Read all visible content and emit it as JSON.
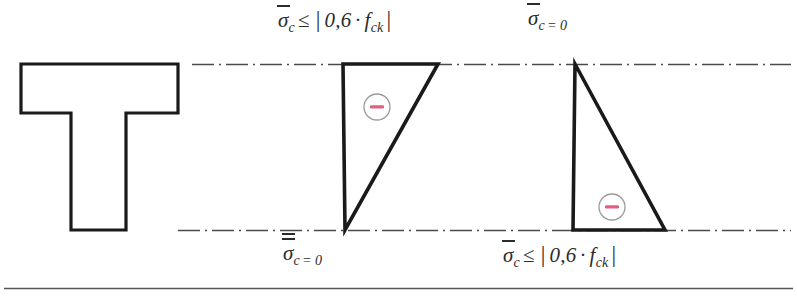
{
  "figure": {
    "colors": {
      "outline": "#1a1a1a",
      "centerline": "#4a4a4a",
      "sign_circle_stroke": "#9a9a9a",
      "sign_mark": "#e0607e",
      "text": "#2b2b2b",
      "footer_rule": "#555555",
      "background": "#ffffff"
    }
  },
  "labels": {
    "top_left": {
      "name": "stress-limit-top-left",
      "sigma": "σ",
      "subscript": "c",
      "overbars": 1,
      "relation": "≤",
      "open_bar": "|",
      "coefficient": "0,6",
      "dot": "·",
      "f_symbol": "f",
      "f_subscript": "ck",
      "close_bar": "|",
      "plain_text": "σ̄c ≤ | 0,6 · fck |"
    },
    "top_right": {
      "name": "stress-zero-top-right",
      "sigma": "σ",
      "subscript": "c",
      "overbars": 2,
      "relation": "=",
      "value": "0",
      "plain_text": "σ̅̅c = 0"
    },
    "bottom_left": {
      "name": "stress-zero-bottom-left",
      "sigma": "σ",
      "subscript": "c",
      "overbars": 2,
      "relation": "=",
      "value": "0",
      "plain_text": "σ̅̅c = 0"
    },
    "bottom_right": {
      "name": "stress-limit-bottom-right",
      "sigma": "σ",
      "subscript": "c",
      "overbars": 1,
      "relation": "≤",
      "open_bar": "|",
      "coefficient": "0,6",
      "dot": "·",
      "f_symbol": "f",
      "f_subscript": "ck",
      "close_bar": "|",
      "plain_text": "σ̄c ≤ | 0,6 · fck |"
    }
  },
  "sign_markers": [
    {
      "name": "compression-sign-diagram-1",
      "glyph": "−",
      "cx": 377,
      "cy": 107,
      "r": 13
    },
    {
      "name": "compression-sign-diagram-2",
      "glyph": "−",
      "cx": 612,
      "cy": 207,
      "r": 13
    }
  ],
  "geometry": {
    "t_section": {
      "name": "t-beam-cross-section",
      "points": "21,64 178,64 178,113 126,113 126,230 71,230 71,113 21,113",
      "flange_top_y": 64,
      "flange_bottom_y": 113,
      "web_bottom_y": 230,
      "flange_left_x": 21,
      "flange_right_x": 178,
      "web_left_x": 71,
      "web_right_x": 126
    },
    "stress_diagram_1": {
      "name": "stress-triangle-top-compression",
      "points": "343,64 438,64 345,230",
      "apex_bottom_x": 345,
      "top_left_x": 343,
      "top_right_x": 438
    },
    "stress_diagram_2": {
      "name": "stress-triangle-bottom-compression",
      "points": "575,64 665,230 573,230",
      "apex_top_x": 575,
      "bottom_left_x": 573,
      "bottom_right_x": 665
    },
    "centerline_top": {
      "name": "reference-axis-top",
      "y": 64,
      "x1": 192,
      "x2": 791
    },
    "centerline_bottom": {
      "name": "reference-axis-bottom",
      "y": 230,
      "x1": 178,
      "x2": 791
    },
    "footer_rule": {
      "name": "figure-footer-rule",
      "y": 288,
      "x1": 4,
      "x2": 793
    }
  }
}
